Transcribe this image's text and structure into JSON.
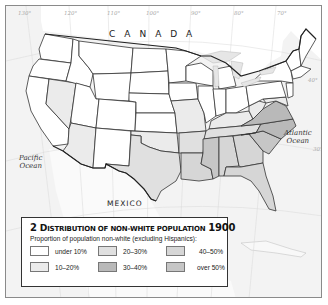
{
  "map": {
    "labels": {
      "canada": "CANADA",
      "mexico": "MEXICO",
      "pacific": "Pacific Ocean",
      "pacific_lines": [
        "Pacific",
        "Ocean"
      ],
      "atlantic_lines": [
        "Atlantic",
        "Ocean"
      ]
    },
    "longitudes": [
      "130°",
      "120°",
      "110°",
      "100°",
      "90°",
      "80°",
      "70°"
    ],
    "latitude_labels": [
      "40°",
      "30°"
    ],
    "colors": {
      "under_10": "#ffffff",
      "10_20": "#ebebeb",
      "20_30": "#e0e0e0",
      "30_40": "#b9b9b9",
      "40_50": "#d6d6d6",
      "over_50": "#c6c6c6",
      "water": "#f3f3f3",
      "border": "#333333"
    },
    "state_categories": {
      "under 10%": [
        "WA",
        "OR",
        "CA",
        "ID",
        "MT",
        "WY",
        "UT",
        "CO",
        "ND",
        "SD",
        "NE",
        "KS",
        "MN",
        "IA",
        "WI",
        "MI",
        "IL",
        "IN",
        "OH",
        "PA",
        "NY",
        "VT",
        "NH",
        "ME",
        "MA",
        "CT",
        "RI",
        "NJ",
        "NM"
      ],
      "10-20%": [
        "NV",
        "AZ",
        "MO",
        "KY",
        "WV",
        "DE",
        "MD",
        "OK"
      ],
      "20-30%": [
        "TX",
        "AR",
        "TN"
      ],
      "30-40%": [
        "VA",
        "NC"
      ],
      "40-50%": [
        "FL",
        "GA",
        "AL",
        "LA"
      ],
      "over 50%": [
        "MS",
        "SC"
      ]
    }
  },
  "legend": {
    "number": "2",
    "title_first": "D",
    "title_rest": "ISTRIBUTION OF NON-WHITE POPULATION",
    "year": "1900",
    "subtitle": "Proportion of population non-white (excluding Hispanics):",
    "items": [
      {
        "label": "under 10%",
        "color": "#ffffff"
      },
      {
        "label": "10–20%",
        "color": "#ebebeb"
      },
      {
        "label": "20–30%",
        "color": "#e0e0e0"
      },
      {
        "label": "30–40%",
        "color": "#b9b9b9"
      },
      {
        "label": "40–50%",
        "color": "#d6d6d6"
      },
      {
        "label": "over 50%",
        "color": "#c6c6c6"
      }
    ]
  }
}
